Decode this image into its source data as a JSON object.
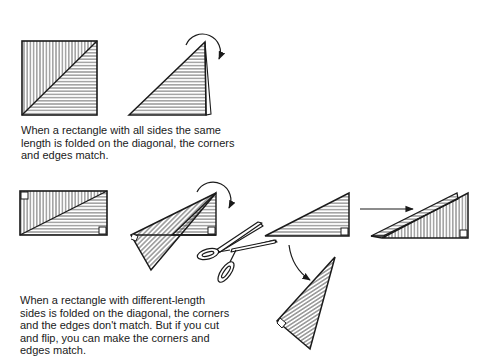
{
  "figure": {
    "line_color": "#1a1a1a",
    "background": "#ffffff",
    "square_example": {
      "steps": [
        "square-hatched",
        "square-folded-on-diagonal"
      ],
      "caption_lines": [
        "When a rectangle with all sides the same",
        "length is folded on the diagonal, the corners",
        "and edges match."
      ]
    },
    "rectangle_example": {
      "steps": [
        "rectangle-hatched",
        "rectangle-folded-on-diagonal",
        "scissors-cut",
        "cut-triangle",
        "flipped-triangle",
        "matched-triangles"
      ],
      "caption_lines": [
        "When a rectangle with different-length",
        "sides is folded on the diagonal, the corners",
        "and the edges don't match. But if you cut",
        "and flip, you can make the corners and",
        "edges match."
      ]
    }
  }
}
